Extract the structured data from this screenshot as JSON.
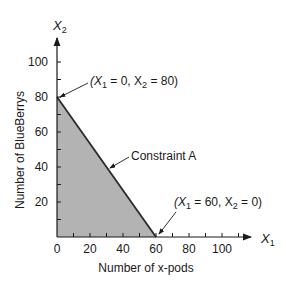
{
  "chart_data": {
    "type": "area",
    "title": "",
    "xlabel": "Number of x-pods",
    "ylabel": "Number of BlueBerrys",
    "x_axis_symbol": "X",
    "x_axis_subscript": "1",
    "y_axis_symbol": "X",
    "y_axis_subscript": "2",
    "xlim": [
      0,
      120
    ],
    "ylim": [
      0,
      110
    ],
    "x_ticks": [
      0,
      20,
      40,
      60,
      80,
      100
    ],
    "y_ticks": [
      20,
      40,
      60,
      80,
      100
    ],
    "x_tick_labels": [
      "0",
      "20",
      "40",
      "60",
      "80",
      "100"
    ],
    "y_tick_labels": [
      "20",
      "40",
      "60",
      "80",
      "100"
    ],
    "minor_tick_step": 10,
    "grid": false,
    "series": [
      {
        "name": "Constraint A",
        "x": [
          0,
          60
        ],
        "y": [
          80,
          0
        ]
      }
    ],
    "feasible_region": {
      "vertices": [
        [
          0,
          0
        ],
        [
          0,
          80
        ],
        [
          60,
          0
        ]
      ],
      "fill": "#b3b3b3"
    },
    "annotations": [
      {
        "text_prefix": "(X",
        "sub1": "1",
        "mid": " = 0, X",
        "sub2": "2",
        "suffix": " = 80)",
        "points_to": [
          0,
          80
        ]
      },
      {
        "text": "Constraint A",
        "points_to": [
          30,
          40
        ]
      },
      {
        "text_prefix": "(X",
        "sub1": "1",
        "mid": " = 60, X",
        "sub2": "2",
        "suffix": " = 0)",
        "points_to": [
          60,
          0
        ]
      }
    ],
    "colors": {
      "axis": "#1a1a1a",
      "line": "#2a2a2a",
      "fill": "#b3b3b3"
    }
  },
  "labels": {
    "x_title": "Number of x-pods",
    "y_title": "Number of BlueBerrys",
    "x_sym": "X",
    "x_sub": "1",
    "y_sym": "X",
    "y_sub": "2",
    "constraint": "Constraint A",
    "pt1_a": "(X",
    "pt1_s1": "1",
    "pt1_b": " = 0, X",
    "pt1_s2": "2",
    "pt1_c": " = 80)",
    "pt2_a": "(X",
    "pt2_s1": "1",
    "pt2_b": " = 60, X",
    "pt2_s2": "2",
    "pt2_c": " = 0)"
  }
}
